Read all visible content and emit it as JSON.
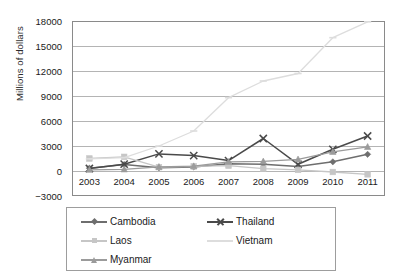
{
  "chart_data": {
    "type": "line",
    "title": "",
    "xlabel": "",
    "ylabel": "Millions of dollars",
    "categories": [
      "2003",
      "2004",
      "2005",
      "2006",
      "2007",
      "2008",
      "2009",
      "2010",
      "2011"
    ],
    "ylim": [
      -3000,
      18000
    ],
    "yticks": [
      18000,
      15000,
      12000,
      9000,
      6000,
      3000,
      0,
      -3000
    ],
    "ytick_labels": [
      "18000",
      "15000",
      "12000",
      "9000",
      "6000",
      "3000",
      "0",
      "−3000"
    ],
    "grid": true,
    "legend_position": "bottom",
    "series": [
      {
        "name": "Cambodia",
        "marker": "diamond",
        "color": "#6e6e6e",
        "values": [
          340,
          780,
          380,
          480,
          870,
          815,
          540,
          1100,
          2000
        ]
      },
      {
        "name": "Thailand",
        "marker": "x",
        "color": "#4a4a4a",
        "values": [
          300,
          820,
          2050,
          1850,
          1250,
          3900,
          800,
          2600,
          4200
        ]
      },
      {
        "name": "Laos",
        "marker": "square",
        "color": "#c6c6c6",
        "values": [
          1500,
          1700,
          460,
          560,
          640,
          280,
          130,
          -120,
          -400
        ]
      },
      {
        "name": "Vietnam",
        "marker": "dash",
        "color": "#dddddd",
        "values": [
          1450,
          1610,
          3000,
          4800,
          8800,
          10800,
          11700,
          16000,
          17900
        ]
      },
      {
        "name": "Myanmar",
        "marker": "triangle",
        "color": "#9b9b9b",
        "values": [
          150,
          200,
          500,
          580,
          1100,
          1150,
          1400,
          2300,
          2900
        ]
      }
    ]
  },
  "legend": {
    "items": [
      {
        "label": "Cambodia"
      },
      {
        "label": "Thailand"
      },
      {
        "label": "Laos"
      },
      {
        "label": "Vietnam"
      },
      {
        "label": "Myanmar"
      }
    ]
  },
  "colors": {
    "grid": "#b4b4b4",
    "axis": "#8a8a8a",
    "text": "#1a1a1a"
  }
}
